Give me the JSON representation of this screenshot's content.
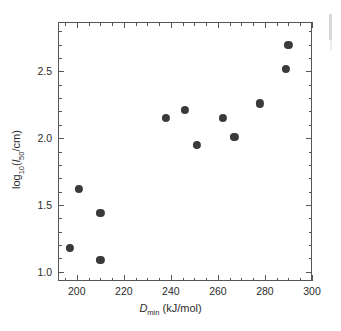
{
  "chart_data": {
    "type": "scatter",
    "title": "",
    "xlabel": "D_min (kJ/mol)",
    "ylabel": "log10(l50/cm)",
    "xlim": [
      192,
      300
    ],
    "ylim": [
      0.93,
      2.87
    ],
    "grid": false,
    "legend": null,
    "x": [
      197,
      201,
      210,
      210,
      238,
      246,
      251,
      262,
      267,
      278,
      289,
      290
    ],
    "y": [
      1.18,
      1.62,
      1.44,
      1.09,
      2.15,
      2.21,
      1.95,
      2.15,
      2.01,
      2.26,
      2.52,
      2.7
    ],
    "points": [
      {
        "x": 197,
        "y": 1.18
      },
      {
        "x": 201,
        "y": 1.62
      },
      {
        "x": 210,
        "y": 1.44
      },
      {
        "x": 210,
        "y": 1.09
      },
      {
        "x": 238,
        "y": 2.15
      },
      {
        "x": 246,
        "y": 2.21
      },
      {
        "x": 251,
        "y": 1.95
      },
      {
        "x": 262,
        "y": 2.15
      },
      {
        "x": 267,
        "y": 2.01
      },
      {
        "x": 278,
        "y": 2.26
      },
      {
        "x": 289,
        "y": 2.52
      },
      {
        "x": 290,
        "y": 2.7
      }
    ],
    "marker_color": "#3a3a3a",
    "xticks": [
      200,
      220,
      240,
      260,
      280,
      300
    ],
    "xtick_labels": [
      "200",
      "220",
      "240",
      "260",
      "280",
      "300"
    ],
    "xminor_step": 5,
    "yticks": [
      1.0,
      1.5,
      2.0,
      2.5
    ],
    "ytick_labels": [
      "1.0",
      "1.5",
      "2.0",
      "2.5"
    ],
    "yminor_step": 0.1
  },
  "axes": {
    "x_axis_label_symbol": "D",
    "x_axis_label_sub": "min",
    "x_axis_label_units": "(kJ/mol)",
    "y_axis_label_prefix": "log",
    "y_axis_label_prefix_sub": "10",
    "y_axis_label_open": "(",
    "y_axis_label_var": "l",
    "y_axis_label_var_sub": "50",
    "y_axis_label_tail": "/cm)"
  }
}
